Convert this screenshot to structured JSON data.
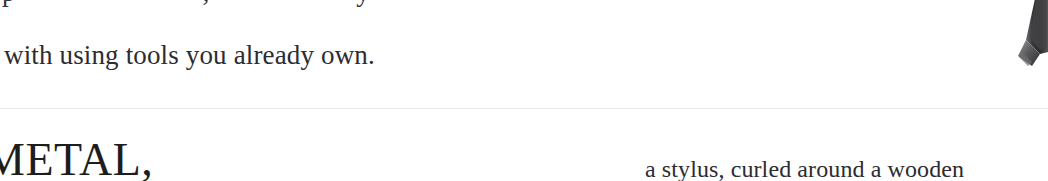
{
  "page": {
    "background_color": "#ffffff",
    "text_color": "#2c2c31",
    "rule_color": "#e9e9ec",
    "width": 1048,
    "height": 181
  },
  "top_clipped_line": {
    "fragment_a": "p",
    "fragment_b": ",",
    "fragment_c": "y"
  },
  "body": {
    "line": "with using tools you already own."
  },
  "heading": {
    "text": "METAL,"
  },
  "right_column": {
    "line": "a stylus, curled around a wooden"
  },
  "figure": {
    "caption_name": "tool-tip-photo"
  }
}
